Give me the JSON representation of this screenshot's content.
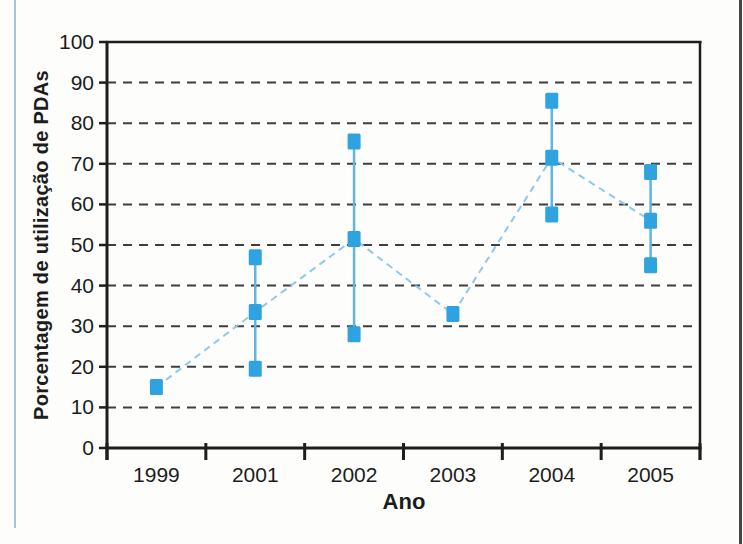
{
  "chart_data": {
    "type": "scatter",
    "title": "",
    "xlabel": "Ano",
    "ylabel": "Porcentagem de utilização de PDAs",
    "categories": [
      "1999",
      "2001",
      "2002",
      "2003",
      "2004",
      "2005"
    ],
    "ylim": [
      0,
      100
    ],
    "ytick_step": 10,
    "grid": "horizontal-dashed",
    "legend": "none",
    "points": [
      {
        "year": "1999",
        "values": [
          15
        ]
      },
      {
        "year": "2001",
        "values": [
          19.5,
          33.5,
          47
        ]
      },
      {
        "year": "2002",
        "values": [
          28,
          51.5,
          75.5
        ]
      },
      {
        "year": "2003",
        "values": [
          33
        ]
      },
      {
        "year": "2004",
        "values": [
          57.5,
          71.5,
          85.5
        ]
      },
      {
        "year": "2005",
        "values": [
          45,
          56,
          68
        ]
      }
    ],
    "range_bars": [
      {
        "year": "2001",
        "min": 19.5,
        "max": 47
      },
      {
        "year": "2002",
        "min": 28,
        "max": 75.5
      },
      {
        "year": "2004",
        "min": 57.5,
        "max": 85.5
      },
      {
        "year": "2005",
        "min": 45,
        "max": 68
      }
    ],
    "trend_line": {
      "style": "dashed",
      "values": [
        15,
        33.5,
        51.5,
        33,
        71.5,
        56
      ]
    },
    "colors": {
      "marker": "#2ea3df",
      "range_line": "#5fb5e5",
      "trend_line": "#90c8ea",
      "gridline": "#3f3f3f",
      "axis": "#1e1e1e",
      "text": "#1c1c1c",
      "page_edge_accent": "#a4c6da",
      "page_border": "#474747",
      "background": "#fdfdfc"
    }
  }
}
